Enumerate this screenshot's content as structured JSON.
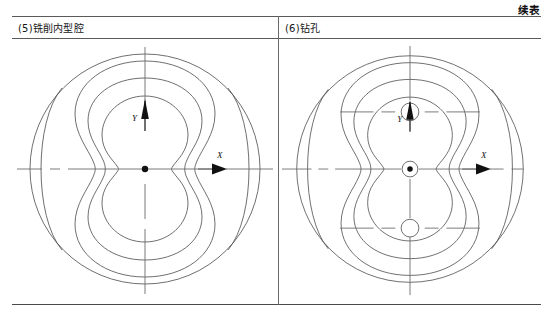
{
  "page": {
    "continued_label": "续表",
    "width": 553,
    "height": 317
  },
  "table": {
    "columns": [
      {
        "caption": "(5)铣削内型腔",
        "step_number": "5",
        "operation": "铣削内型腔"
      },
      {
        "caption": "(6)钻孔",
        "step_number": "6",
        "operation": "钻孔"
      }
    ]
  },
  "figures": [
    {
      "id": "milling-inner-cavity",
      "caption": "(5)铣削内型腔",
      "axis_x_label": "X",
      "axis_y_label": "Y",
      "origin_marker": "filled-dot",
      "outer_circle": {
        "cx": 133,
        "cy": 130,
        "r": 115
      },
      "contours": [
        "outer-circle",
        "outer-peanut-contour",
        "middle-peanut-contour",
        "inner-peanut-cavity"
      ],
      "side_crescents": [
        "left-crescent-arc",
        "right-crescent-arc"
      ],
      "holes": []
    },
    {
      "id": "drilling-holes",
      "caption": "(6)钻孔",
      "axis_x_label": "X",
      "axis_y_label": "Y",
      "origin_marker": "filled-dot",
      "outer_circle": {
        "cx": 133,
        "cy": 130,
        "r": 115
      },
      "contours": [
        "outer-circle",
        "outer-peanut-contour",
        "middle-peanut-contour",
        "inner-peanut-cavity"
      ],
      "side_crescents": [
        "left-crescent-arc",
        "right-crescent-arc"
      ],
      "holes": [
        {
          "name": "upper-hole",
          "cx": 133,
          "cy": 72,
          "r": 9
        },
        {
          "name": "center-hole",
          "cx": 133,
          "cy": 130,
          "r": 8
        },
        {
          "name": "lower-hole",
          "cx": 133,
          "cy": 190,
          "r": 9
        }
      ]
    }
  ],
  "colors": {
    "line": "#4a4a4a",
    "centerline": "#6b6b6b",
    "text": "#151515",
    "rule": "#5a5a5a",
    "background": "#ffffff"
  }
}
